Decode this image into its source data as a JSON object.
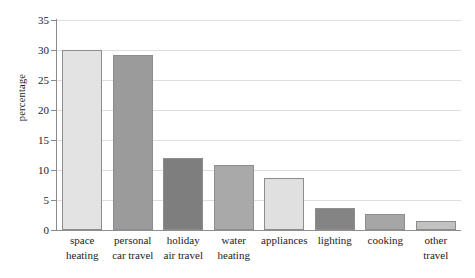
{
  "chart_data": {
    "type": "bar",
    "title": "",
    "xlabel": "",
    "ylabel": "percentage",
    "ylim": [
      0,
      35
    ],
    "yticks": [
      0,
      5,
      10,
      15,
      20,
      25,
      30,
      35
    ],
    "grid": true,
    "legend": "none",
    "categories": [
      "space heating",
      "personal car travel",
      "holiday air travel",
      "water heating",
      "appliances",
      "lighting",
      "cooking",
      "other travel"
    ],
    "category_lines": [
      [
        "space",
        "heating"
      ],
      [
        "personal",
        "car travel"
      ],
      [
        "holiday",
        "air travel"
      ],
      [
        "water",
        "heating"
      ],
      [
        "appliances"
      ],
      [
        "lighting"
      ],
      [
        "cooking"
      ],
      [
        "other",
        "travel"
      ]
    ],
    "values": [
      30.0,
      29.2,
      12.0,
      10.8,
      8.6,
      3.7,
      2.7,
      1.5
    ],
    "bar_colors": [
      "#e3e3e3",
      "#9b9b9b",
      "#7e7e7e",
      "#a9a9a9",
      "#e0e0e0",
      "#848484",
      "#a6a6a6",
      "#c2c2c2"
    ],
    "bar_border_color": "#8d8d8d",
    "grid_color": "#dededf",
    "axis_color": "#8b8b8b",
    "text_color": "#1c1c1c"
  }
}
